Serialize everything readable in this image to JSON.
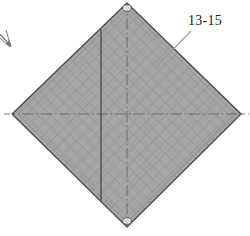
{
  "figure": {
    "kind": "patent-line-drawing",
    "background_color": "#ffffff",
    "title_text": "",
    "panel": {
      "name": "mesh-panel",
      "shape": "diamond",
      "fill_color": "#a9a9a9",
      "outline_color": "#4a4a4a",
      "texture": "diagonal-crosshatch-mesh",
      "vertices": {
        "top": [
          127,
          3
        ],
        "right": [
          241,
          114
        ],
        "bottom": [
          127,
          227
        ],
        "left": [
          12,
          114
        ]
      }
    },
    "holes": [
      {
        "name": "top-grommet",
        "cx": 127,
        "cy": 8,
        "rx": 4.0,
        "ry": 3.0
      },
      {
        "name": "bottom-grommet",
        "cx": 127,
        "cy": 222,
        "rx": 4.0,
        "ry": 3.0
      }
    ],
    "center_lines": [
      {
        "name": "horizontal-centerline",
        "style": "dash-dot",
        "color": "#5a5a5a"
      },
      {
        "name": "vertical-centerline",
        "style": "dash-dot",
        "color": "#5a5a5a"
      }
    ],
    "fold_line": {
      "name": "vertical-fold-line",
      "style": "solid",
      "color": "#3a3a3a",
      "x": 101
    },
    "callout": {
      "label": "13-15",
      "leader_color": "#8a8a8a",
      "leader_from": [
        191,
        31
      ],
      "leader_to": [
        157,
        66
      ]
    },
    "arrow_marker": {
      "name": "view-direction-arrow",
      "color": "#6f6f6f",
      "direction": "down-left"
    }
  }
}
